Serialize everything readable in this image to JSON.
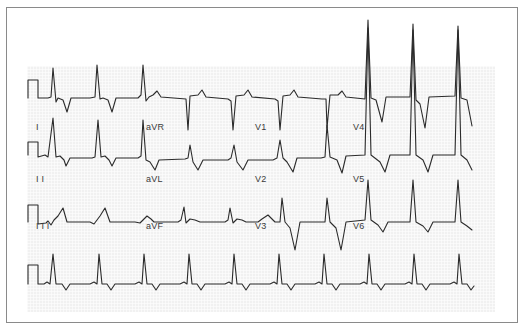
{
  "figure": {
    "colors": {
      "trace": "#2b2b2b",
      "grid_bg": "#f1f1f1",
      "frame": "#8a8a8a",
      "label": "#3a3a3a"
    }
  },
  "leads": [
    {
      "id": "I",
      "label": "I",
      "x": 36,
      "y": 128
    },
    {
      "id": "aVR",
      "label": "aVR",
      "x": 146,
      "y": 128
    },
    {
      "id": "V1",
      "label": "V1",
      "x": 255,
      "y": 128
    },
    {
      "id": "V4",
      "label": "V4",
      "x": 353,
      "y": 128
    },
    {
      "id": "II",
      "label": "I I",
      "x": 36,
      "y": 180
    },
    {
      "id": "aVL",
      "label": "aVL",
      "x": 146,
      "y": 180
    },
    {
      "id": "V2",
      "label": "V2",
      "x": 255,
      "y": 180
    },
    {
      "id": "V5",
      "label": "V5",
      "x": 353,
      "y": 180
    },
    {
      "id": "III",
      "label": "I I I",
      "x": 36,
      "y": 227
    },
    {
      "id": "aVF",
      "label": "aVF",
      "x": 146,
      "y": 227
    },
    {
      "id": "V3",
      "label": "V3",
      "x": 255,
      "y": 227
    },
    {
      "id": "V6",
      "label": "V6",
      "x": 353,
      "y": 227
    }
  ],
  "rows": [
    {
      "name": "row-1",
      "baseline": 98,
      "segments": [
        "I",
        "aVR",
        "V1",
        "V4"
      ]
    },
    {
      "name": "row-2",
      "baseline": 155,
      "segments": [
        "II",
        "aVL",
        "V2",
        "V5"
      ]
    },
    {
      "name": "row-3",
      "baseline": 222,
      "segments": [
        "III",
        "aVF",
        "V3",
        "V6"
      ]
    },
    {
      "name": "rhythm-strip",
      "baseline": 284,
      "segments": [
        "II"
      ]
    }
  ],
  "traces": {
    "row1": "M28,98 L28,80 L38,80 L38,98 L48,98 L51,97 L53,68 L56,102 L58,98 L63,100 L67,112 L71,98 L90,98 L95,97 L97,65 L100,99 L103,98 L108,100 L112,112 L116,98 L138,98 L141,95 L143,65 L146,101 L149,97 L153,95 L157,91 L161,97 L186,99 L188,130 L190,96 L198,95 L202,90 L206,97 L228,99 L231,101 L233,130 L236,96 L244,95 L248,90 L252,97 L275,99 L278,101 L280,130 L283,96 L290,95 L294,90 L298,97 L322,99 L326,99 L327,128 L330,95 L338,95 L342,91 L346,97 L365,99 L368,20 L371,98 L376,100 L382,122 L386,97 L410,97 L413,24 L416,100 L420,104 L425,128 L429,97 L455,96 L458,26 L461,98 L467,100 L472,126",
    "row2": "M28,155 L28,142 L38,142 L38,157 L45,155 L48,157 L53,118 L56,157 L60,156 L64,160 L66,166 L70,158 L92,158 L95,157 L98,120 L101,157 L105,156 L109,160 L112,166 L116,158 L138,158 L141,156 L143,120 L146,160 L150,162 L155,170 L159,160 L185,159 L188,158 L190,145 L193,162 L198,170 L203,160 L228,160 L231,158 L234,145 L237,162 L243,170 L248,160 L273,160 L277,158 L280,140 L283,158 L287,162 L293,172 L297,158 L321,158 L325,157 L327,125 L330,157 L337,160 L342,173 L346,156 L365,155 L368,28 L371,155 L380,162 L385,172 L390,155 L410,155 L413,30 L416,155 L423,160 L428,172 L433,155 L455,155 L458,30 L461,155 L467,160 L472,170",
    "row3": "M28,222 L28,205 L38,205 L38,224 L46,223 L48,221 L51,225 L54,220 L58,216 L63,208 L67,222 L90,222 L94,224 L97,220 L100,216 L105,208 L110,222 L135,222 L140,223 L143,220 L147,216 L151,219 L154,222 L178,222 L181,220 L184,207 L186,223 L190,219 L195,220 L200,222 L225,222 L228,220 L230,208 L233,223 L237,219 L242,220 L246,222 L258,222 L262,219 L268,215 L275,222 L280,222 L282,198 L285,222 L290,228 L295,250 L300,222 L320,222 L325,222 L327,198 L330,222 L336,228 L341,250 L346,222 L365,220 L368,180 L371,220 L378,225 L383,232 L388,222 L410,222 L413,180 L416,222 L423,226 L428,232 L433,222 L455,222 L458,180 L461,222 L467,226 L472,230",
    "rhythm": "M28,284 L28,265 L38,265 L38,284 L44,284 L47,282 L50,284 L53,254 L56,284 L62,284 L66,290 L70,284 L90,284 L94,282 L97,284 L99,254 L102,284 L107,284 L111,290 L115,284 L135,284 L139,282 L142,284 L144,254 L147,284 L152,284 L156,290 L160,284 L180,284 L184,282 L187,284 L189,254 L192,284 L197,284 L201,290 L205,284 L225,284 L229,282 L232,284 L234,254 L237,284 L242,284 L246,290 L250,284 L270,284 L274,282 L277,284 L279,254 L282,284 L287,284 L291,290 L295,284 L315,284 L319,282 L322,284 L324,254 L327,284 L332,284 L336,290 L340,284 L360,284 L364,282 L367,284 L369,254 L372,284 L377,284 L381,290 L385,284 L405,284 L409,282 L412,284 L414,254 L417,284 L422,284 L426,290 L430,284 L450,284 L454,282 L457,284 L459,254 L462,284 L467,284 L471,290 L474,286"
  }
}
